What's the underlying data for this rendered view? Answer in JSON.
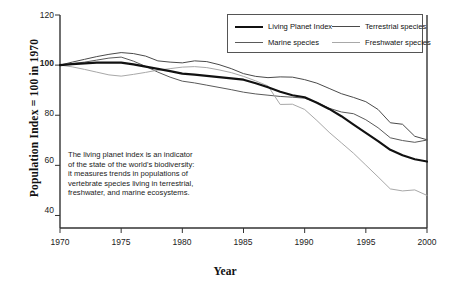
{
  "chart_data": {
    "type": "line",
    "title": "",
    "xlabel": "Year",
    "ylabel": "Population Index = 100 in 1970",
    "xlim": [
      1970,
      2000
    ],
    "ylim": [
      35,
      120
    ],
    "grid": false,
    "legend_position": "top-right-inside",
    "xticks": [
      "1970",
      "1975",
      "1980",
      "1985",
      "1990",
      "1995",
      "2000"
    ],
    "yticks": [
      "40",
      "60",
      "80",
      "100",
      "120"
    ],
    "ytick_bold": "100",
    "annotation": [
      "The living planet index is an indicator",
      "of the state of the world's biodiversity:",
      "it measures trends in populations of",
      "vertebrate species living in terrestrial,",
      "freshwater, and marine ecosystems."
    ],
    "x": [
      1970,
      1971,
      1972,
      1973,
      1974,
      1975,
      1976,
      1977,
      1978,
      1979,
      1980,
      1981,
      1982,
      1983,
      1984,
      1985,
      1986,
      1987,
      1988,
      1989,
      1990,
      1991,
      1992,
      1993,
      1994,
      1995,
      1996,
      1997,
      1998,
      1999,
      2000
    ],
    "series": [
      {
        "name": "Living Planet Index",
        "color": "#111111",
        "width": 2.1,
        "values": [
          100,
          100.4,
          100.7,
          101,
          101,
          101,
          100.3,
          99.4,
          98.5,
          97.6,
          96.6,
          96.2,
          95.7,
          95.2,
          94.7,
          94.2,
          92.8,
          91.2,
          89.4,
          88,
          87.2,
          85,
          82.5,
          79.6,
          76.3,
          73,
          69.7,
          66.2,
          64,
          62.4,
          61.5
        ]
      },
      {
        "name": "Terrestrial species",
        "color": "#4a4a4a",
        "width": 1.0,
        "values": [
          100,
          101.2,
          102.3,
          103.4,
          104.3,
          105,
          104.6,
          103.6,
          101.7,
          101.2,
          100.9,
          101.7,
          101.4,
          100.2,
          98.6,
          96.6,
          95.5,
          95,
          95.3,
          95.2,
          94.2,
          92.8,
          90.7,
          88.6,
          87.1,
          85.4,
          82.3,
          77,
          76.4,
          71.6,
          70.2
        ]
      },
      {
        "name": "Marine species",
        "color": "#5a5a5a",
        "width": 1.0,
        "values": [
          100,
          100.6,
          101.2,
          102,
          102.8,
          103.2,
          101.6,
          99.5,
          97.2,
          95.2,
          93.6,
          92.9,
          92,
          91.1,
          90.2,
          89.2,
          88.5,
          88,
          87.5,
          87.2,
          86.8,
          85.1,
          82.8,
          81.3,
          80.6,
          78.2,
          75,
          71,
          69.9,
          69.2,
          70.1
        ]
      },
      {
        "name": "Freshwater species",
        "color": "#a8a8a8",
        "width": 1.0,
        "values": [
          100,
          99.3,
          98.3,
          97.2,
          96.1,
          95.6,
          96.3,
          97.1,
          98,
          98.6,
          99.2,
          99.4,
          99,
          98.1,
          97,
          95.5,
          93.7,
          91.7,
          84.3,
          84.4,
          82.3,
          77.9,
          73.2,
          69,
          64.8,
          60.1,
          55.4,
          50.6,
          49.8,
          50.2,
          48
        ]
      }
    ]
  },
  "legend": {
    "entries": [
      {
        "label": "Living Planet Index",
        "color": "#111111",
        "width": 2.4
      },
      {
        "label": "Terrestrial species",
        "color": "#4a4a4a",
        "width": 1.3
      },
      {
        "label": "Marine species",
        "color": "#5a5a5a",
        "width": 1.3
      },
      {
        "label": "Freshwater species",
        "color": "#a8a8a8",
        "width": 1.3
      }
    ]
  },
  "axes": {
    "frame_color": "#333333"
  }
}
